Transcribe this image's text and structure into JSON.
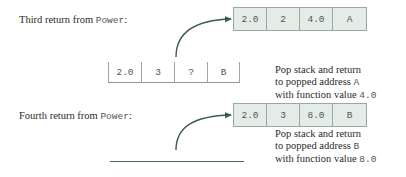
{
  "colors": {
    "arrow": "#3d5a52",
    "cell_fill": "#e4ece8",
    "cell_border": "#9aa8a2",
    "text": "#2a2a2a"
  },
  "third_return": {
    "caption_prefix": "Third return from ",
    "caption_func": "Power",
    "caption_suffix": ":",
    "result_frame": [
      "2.0",
      "2",
      "4.0",
      "A"
    ],
    "remaining_frame": [
      "2.0",
      "3",
      "?",
      "B"
    ],
    "note": {
      "line1": "Pop stack and return",
      "line2_prefix": "to popped address ",
      "line2_code": "A",
      "line3_prefix": "with function value ",
      "line3_code": "4.0"
    }
  },
  "fourth_return": {
    "caption_prefix": "Fourth return from ",
    "caption_func": "Power",
    "caption_suffix": ":",
    "result_frame": [
      "2.0",
      "3",
      "8.0",
      "B"
    ],
    "note": {
      "line1": "Pop stack and return",
      "line2_prefix": "to popped address ",
      "line2_code": "B",
      "line3_prefix": "with function value ",
      "line3_code": "8.0"
    }
  }
}
